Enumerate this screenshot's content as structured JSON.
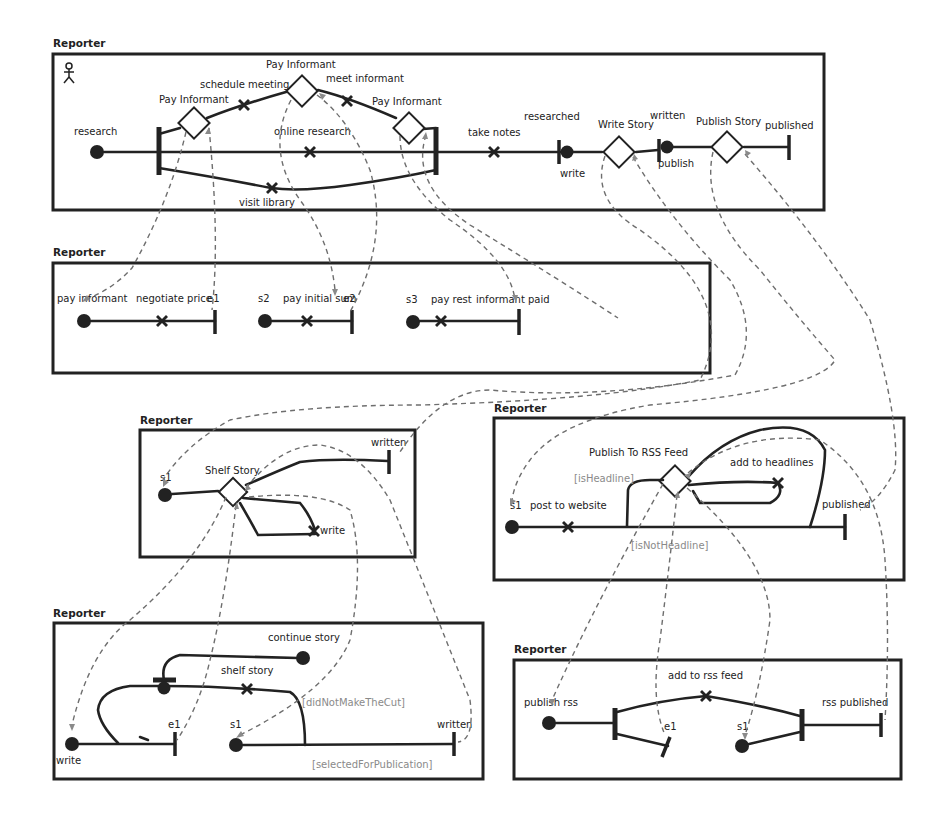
{
  "diagram": {
    "type": "use-case-map-stubs",
    "actor_icon": "stick-figure-icon",
    "panels": [
      {
        "id": "root",
        "title": "Reporter",
        "start_point": "research",
        "stubs": [
          "Pay Informant",
          "Pay Informant",
          "Pay Informant",
          "Write Story",
          "Publish Story"
        ],
        "responsibilities": [
          "schedule meeting",
          "meet informant",
          "online research",
          "visit library",
          "take notes"
        ],
        "labels": {
          "research": "research",
          "pay_informant_top": "Pay Informant",
          "pay_informant_left": "Pay Informant",
          "pay_informant_right": "Pay Informant",
          "schedule_meeting": "schedule meeting",
          "meet_informant": "meet informant",
          "online_research": "online research",
          "visit_library": "visit library",
          "take_notes": "take notes",
          "researched": "researched",
          "write": "write",
          "write_story": "Write Story",
          "written": "written",
          "publish": "publish",
          "publish_story": "Publish Story",
          "published": "published"
        }
      },
      {
        "id": "pay-informant",
        "title": "Reporter",
        "labels": {
          "pay_informant": "pay informant",
          "negotiate_price": "negotiate price",
          "e1": "e1",
          "s2": "s2",
          "pay_initial_sum": "pay initial sum",
          "e2": "e2",
          "s3": "s3",
          "pay_rest": "pay rest",
          "informant_paid": "informant paid"
        }
      },
      {
        "id": "shelf",
        "title": "Reporter",
        "labels": {
          "s1": "s1",
          "shelf_story": "Shelf Story",
          "written": "written",
          "write": "write"
        }
      },
      {
        "id": "publish-rss",
        "title": "Reporter",
        "labels": {
          "publish_to_rss_feed": "Publish To RSS Feed",
          "add_to_headlines": "add to headlines",
          "is_headline": "[isHeadline]",
          "s1": "s1",
          "post_to_website": "post to website",
          "published": "published",
          "is_not_headline": "[isNotHeadline]"
        }
      },
      {
        "id": "write-story",
        "title": "Reporter",
        "labels": {
          "continue_story": "continue story",
          "shelf_story": "shelf story",
          "did_not_make_the_cut": "[didNotMakeTheCut]",
          "e1": "e1",
          "s1": "s1",
          "written": "written",
          "write": "write",
          "selected_for_publication": "[selectedForPublication]"
        }
      },
      {
        "id": "rss",
        "title": "Reporter",
        "labels": {
          "add_to_rss_feed": "add to rss feed",
          "publish_rss": "publish rss",
          "rss_published": "rss published",
          "e1": "e1",
          "s1": "s1"
        }
      }
    ],
    "colors": {
      "stroke": "#222222",
      "binding": "#6e6e6e",
      "guard_text": "#8a8a8a",
      "background": "#ffffff"
    }
  }
}
